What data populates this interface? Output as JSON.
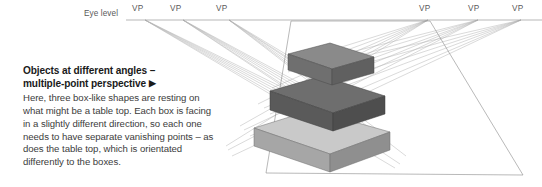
{
  "figure": {
    "eye_level_label": "Eye level",
    "vanishing_points": [
      {
        "label": "VP",
        "x": 132,
        "y": 4,
        "conv_x": 145,
        "conv_y": 20
      },
      {
        "label": "VP",
        "x": 170,
        "y": 4,
        "conv_x": 183,
        "conv_y": 20
      },
      {
        "label": "VP",
        "x": 216,
        "y": 4,
        "conv_x": 229,
        "conv_y": 20
      },
      {
        "label": "VP",
        "x": 419,
        "y": 4,
        "conv_x": 428,
        "conv_y": 20
      },
      {
        "label": "VP",
        "x": 468,
        "y": 4,
        "conv_x": 478,
        "conv_y": 20
      },
      {
        "label": "VP",
        "x": 512,
        "y": 4,
        "conv_x": 521,
        "conv_y": 20
      }
    ],
    "horizon_line": {
      "x1": 126,
      "x2": 542,
      "y": 20
    },
    "colors": {
      "horizon": "#9a9a9a",
      "construction_line": "#b4b4b4",
      "table_outline": "#8a8a8a",
      "box_bottom_top": "#c9c9c9",
      "box_bottom_left": "#a6a6a6",
      "box_bottom_right": "#8f8f8f",
      "box_middle_top": "#6e6e6e",
      "box_middle_left": "#5a5a5a",
      "box_middle_right": "#4e4e4e",
      "box_top_top": "#8a8a8a",
      "box_top_left": "#6f6f6f",
      "box_top_right": "#606060",
      "text_heading": "#1a1a1a",
      "text_body": "#3c3c3c",
      "label": "#5a5a5a",
      "background": "#ffffff"
    },
    "table_top": {
      "front_left": [
        266,
        173
      ],
      "front_right": [
        523,
        175
      ],
      "back_left": [
        291,
        21
      ],
      "back_right": [
        430,
        21
      ]
    },
    "boxes": [
      {
        "name": "bottom-box",
        "shade": "light"
      },
      {
        "name": "middle-box",
        "shade": "dark"
      },
      {
        "name": "top-box",
        "shade": "medium"
      }
    ]
  },
  "caption": {
    "heading_line1": "Objects at different angles –",
    "heading_line2": "multiple-point perspective",
    "heading_arrow": "▶",
    "body": "Here, three box-like shapes are resting on what might be a table top. Each box is facing in a slightly different direction, so each one needs to have separate vanishing points – as does the table top, which is orientated differently to the boxes."
  }
}
